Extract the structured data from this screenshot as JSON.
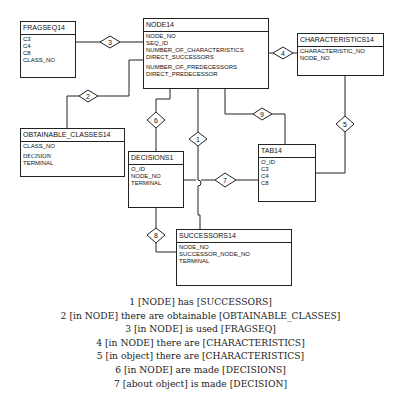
{
  "entities": {
    "fragseq": {
      "title": "FRAGSEQ14",
      "attrs": [
        "C3",
        "C4",
        "C8",
        "CLASS_NO"
      ]
    },
    "node": {
      "title": "NODE14",
      "attrs": [
        "NODE_NO",
        "SEQ_ID",
        "NUMBER_OF_CHARACTERISTICS",
        "DIRECT_SUCCESSORS",
        "NUMBER_OF_PREDECESSORS",
        "DIRECT_PREDECESSOR"
      ]
    },
    "characteristics": {
      "title": "CHARACTERISTICS14",
      "attrs": [
        "CHARACTERISTIC_NO",
        "NODE_NO"
      ]
    },
    "obtainable_classes": {
      "title": "OBTAINABLE_CLASSES14",
      "attrs": [
        "CLASS_NO",
        "DECISION",
        "TERMINAL"
      ]
    },
    "decisions": {
      "title": "DECISIONS1",
      "attrs": [
        "O_ID",
        "NODE_NO",
        "TERMINAL"
      ]
    },
    "tab": {
      "title": "TAB14",
      "attrs": [
        "O_ID",
        "C3",
        "C4",
        "C8"
      ]
    },
    "successors": {
      "title": "SUCCESSORS14",
      "attrs": [
        "NODE_NO",
        "SUCCESSOR_NODE_NO",
        "TERMINAL"
      ]
    }
  },
  "relationships": [
    {
      "id": "1",
      "label": "1"
    },
    {
      "id": "2",
      "label": "2"
    },
    {
      "id": "3",
      "label": "3"
    },
    {
      "id": "4",
      "label": "4"
    },
    {
      "id": "5",
      "label": "5"
    },
    {
      "id": "6",
      "label": "6"
    },
    {
      "id": "7",
      "label": "7"
    },
    {
      "id": "8",
      "label": "8"
    },
    {
      "id": "9",
      "label": "9"
    }
  ],
  "caption": [
    "1 [NODE] has [SUCCESSORS]",
    "2 [in NODE] there are obtainable [OBTAINABLE_CLASSES]",
    "3 [in NODE] is used [FRAGSEQ]",
    "4 [in NODE] there are [CHARACTERISTICS]",
    "5 [in object] there are [CHARACTERISTICS]",
    "6 [in NODE] are made [DECISIONS]",
    "7 [about object] is made [DECISION]"
  ]
}
